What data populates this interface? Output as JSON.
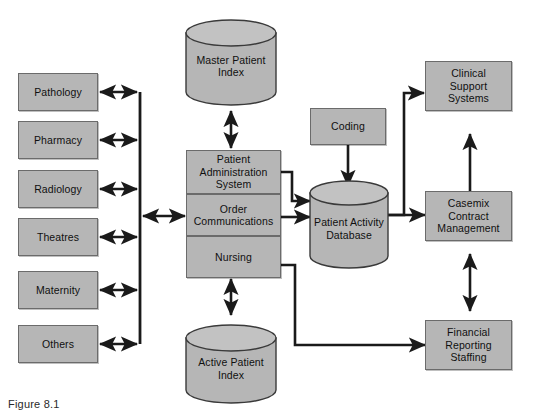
{
  "figure": {
    "caption": "Figure  8.1",
    "fill_color": "#b6b6b6",
    "stroke_color": "#6b6b6b",
    "line_color": "#1a1a1a",
    "background": "#ffffff"
  },
  "feeder_systems": {
    "group_name": "departmental-feeder-systems",
    "items": [
      {
        "id": "pathology",
        "label": "Pathology"
      },
      {
        "id": "pharmacy",
        "label": "Pharmacy"
      },
      {
        "id": "radiology",
        "label": "Radiology"
      },
      {
        "id": "theatres",
        "label": "Theatres"
      },
      {
        "id": "maternity",
        "label": "Maternity"
      },
      {
        "id": "others",
        "label": "Others"
      }
    ]
  },
  "core": {
    "pas": {
      "rows": [
        {
          "id": "patient-administration-system",
          "line1": "Patient",
          "line2": "Administration",
          "line3": "System"
        },
        {
          "id": "order-communications",
          "line1": "Order",
          "line2": "Communications",
          "line3": ""
        },
        {
          "id": "nursing",
          "line1": "Nursing",
          "line2": "",
          "line3": ""
        }
      ]
    }
  },
  "databases": {
    "master_patient_index": {
      "id": "master-patient-index",
      "line1": "Master",
      "line2": "Patient",
      "line3": "Index"
    },
    "active_patient_index": {
      "id": "active-patient-index",
      "line1": "Active",
      "line2": "Patient",
      "line3": "Index"
    },
    "patient_activity_database": {
      "id": "patient-activity-database",
      "line1": "Patient",
      "line2": "Activity",
      "line3": "Database"
    }
  },
  "inputs": {
    "coding": {
      "id": "coding",
      "label": "Coding"
    }
  },
  "downstream": {
    "clinical_support": {
      "id": "clinical-support-systems",
      "line1": "Clinical",
      "line2": "Support",
      "line3": "Systems"
    },
    "casemix": {
      "id": "casemix-contract-management",
      "line1": "Casemix",
      "line2": "Contract",
      "line3": "Management"
    },
    "financial": {
      "id": "financial-reporting-staffing",
      "line1": "Financial",
      "line2": "Reporting",
      "line3": "Staffing"
    }
  },
  "connections": [
    {
      "id": "pathology-to-bus",
      "type": "double-arrow",
      "direction": "horizontal"
    },
    {
      "id": "pharmacy-to-bus",
      "type": "double-arrow",
      "direction": "horizontal"
    },
    {
      "id": "radiology-to-bus",
      "type": "double-arrow",
      "direction": "horizontal"
    },
    {
      "id": "theatres-to-bus",
      "type": "double-arrow",
      "direction": "horizontal"
    },
    {
      "id": "maternity-to-bus",
      "type": "double-arrow",
      "direction": "horizontal"
    },
    {
      "id": "others-to-bus",
      "type": "double-arrow",
      "direction": "horizontal"
    },
    {
      "id": "bus-to-order-communications",
      "type": "double-arrow",
      "direction": "horizontal"
    },
    {
      "id": "pas-to-master-patient-index",
      "type": "double-arrow",
      "direction": "vertical"
    },
    {
      "id": "nursing-to-active-patient-index",
      "type": "double-arrow",
      "direction": "vertical"
    },
    {
      "id": "pas-to-patient-activity-database",
      "type": "single-arrow",
      "direction": "right"
    },
    {
      "id": "order-communications-to-patient-activity-database",
      "type": "single-arrow",
      "direction": "right"
    },
    {
      "id": "coding-to-patient-activity-database",
      "type": "single-arrow",
      "direction": "down"
    },
    {
      "id": "patient-activity-database-to-clinical-support",
      "type": "single-arrow",
      "direction": "up-right"
    },
    {
      "id": "patient-activity-database-to-casemix",
      "type": "single-arrow",
      "direction": "right"
    },
    {
      "id": "nursing-to-financial-reporting",
      "type": "single-arrow",
      "direction": "right"
    },
    {
      "id": "casemix-to-clinical-support",
      "type": "single-arrow",
      "direction": "up"
    },
    {
      "id": "casemix-to-financial-reporting",
      "type": "double-arrow",
      "direction": "vertical"
    }
  ]
}
